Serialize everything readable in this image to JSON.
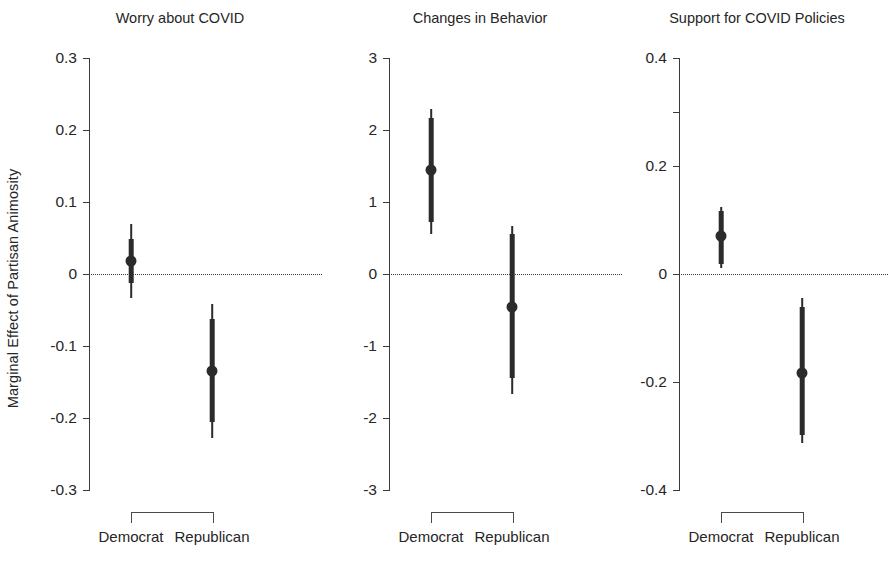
{
  "figure": {
    "ylabel": "Marginal Effect of Partisan Animosity",
    "width": 894,
    "height": 577,
    "background": "#ffffff",
    "ink_color": "#2b2b2b"
  },
  "chart_data": {
    "type": "scatter",
    "title": "",
    "subtitle": "",
    "xlabel": "",
    "ylabel": "Marginal Effect of Partisan Animosity",
    "grid": false,
    "legend": null,
    "reference_line": {
      "y": 0,
      "style": "dotted"
    },
    "categories": [
      "Democrat",
      "Republican"
    ],
    "panels": [
      {
        "title": "Worry about COVID",
        "ylim": [
          -0.3,
          0.3
        ],
        "yticks": [
          0.3,
          0.2,
          0.1,
          0,
          -0.1,
          -0.2,
          -0.3
        ],
        "yticklabels": [
          "0.3",
          "0.2",
          "0.1",
          "0",
          "-0.1",
          "-0.2",
          "-0.3"
        ],
        "points": [
          {
            "group": "Democrat",
            "estimate": 0.018,
            "ci_inner": [
              -0.012,
              0.048
            ],
            "ci_outer": [
              -0.033,
              0.069
            ]
          },
          {
            "group": "Republican",
            "estimate": -0.135,
            "ci_inner": [
              -0.205,
              -0.063
            ],
            "ci_outer": [
              -0.228,
              -0.042
            ]
          }
        ]
      },
      {
        "title": "Changes in Behavior",
        "ylim": [
          -3,
          3
        ],
        "yticks": [
          3,
          2,
          1,
          0,
          -1,
          -2,
          -3
        ],
        "yticklabels": [
          "3",
          "2",
          "1",
          "0",
          "-1",
          "-2",
          "-3"
        ],
        "points": [
          {
            "group": "Democrat",
            "estimate": 1.45,
            "ci_inner": [
              0.72,
              2.17
            ],
            "ci_outer": [
              0.55,
              2.29
            ]
          },
          {
            "group": "Republican",
            "estimate": -0.46,
            "ci_inner": [
              -1.45,
              0.55
            ],
            "ci_outer": [
              -1.66,
              0.67
            ]
          }
        ]
      },
      {
        "title": "Support for COVID Policies",
        "ylim": [
          -0.4,
          0.4
        ],
        "yticks": [
          0.4,
          0.3,
          0.2,
          0,
          -0.2,
          -0.4
        ],
        "yticklabels": [
          "0.4",
          "",
          "0.2",
          "0",
          "-0.2",
          "-0.4"
        ],
        "points": [
          {
            "group": "Democrat",
            "estimate": 0.07,
            "ci_inner": [
              0.018,
              0.116
            ],
            "ci_outer": [
              0.012,
              0.125
            ]
          },
          {
            "group": "Republican",
            "estimate": -0.183,
            "ci_inner": [
              -0.298,
              -0.062
            ],
            "ci_outer": [
              -0.313,
              -0.045
            ]
          }
        ]
      }
    ]
  }
}
